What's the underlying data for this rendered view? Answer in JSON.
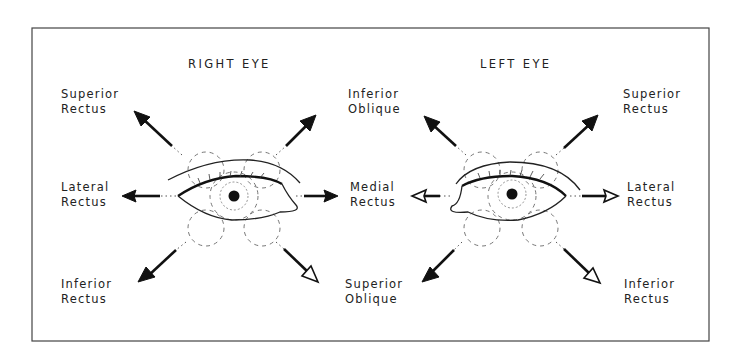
{
  "figure": {
    "right_eye": {
      "title": "RIGHT EYE",
      "labels": {
        "superior_rectus": [
          "Superior",
          "Rectus"
        ],
        "inferior_oblique": [
          "Inferior",
          "Oblique"
        ],
        "lateral_rectus": [
          "Lateral",
          "Rectus"
        ],
        "medial_rectus": [
          "Medial",
          "Rectus"
        ],
        "inferior_rectus": [
          "Inferior",
          "Rectus"
        ],
        "superior_oblique": [
          "Superior",
          "Oblique"
        ]
      }
    },
    "left_eye": {
      "title": "LEFT EYE",
      "labels": {
        "inferior_oblique": [
          "Inferior",
          "Oblique"
        ],
        "superior_rectus": [
          "Superior",
          "Rectus"
        ],
        "medial_rectus": [
          "Medial",
          "Rectus"
        ],
        "lateral_rectus": [
          "Lateral",
          "Rectus"
        ],
        "superior_oblique": [
          "Superior",
          "Oblique"
        ],
        "inferior_rectus": [
          "Inferior",
          "Rectus"
        ]
      }
    },
    "colors": {
      "ink": "#111111",
      "frame": "#444444",
      "background": "#ffffff"
    }
  }
}
